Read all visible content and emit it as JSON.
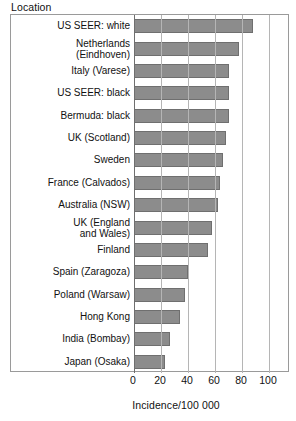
{
  "header": {
    "location_label": "Location"
  },
  "axis": {
    "x_title": "Incidence/100 000",
    "x_ticks": [
      "0",
      "20",
      "40",
      "60",
      "80",
      "100"
    ]
  },
  "colors": {
    "bar_fill": "#8c8c8c",
    "bar_stroke": "#6f6f6f",
    "gridline": "#b5b5b5",
    "frame": "#9a9a9a",
    "text": "#111111"
  },
  "chart_data": {
    "type": "bar",
    "orientation": "horizontal",
    "title": "",
    "subtitle": "",
    "xlabel": "Incidence/100 000",
    "ylabel": "Location",
    "xlim": [
      0,
      100
    ],
    "xticks": [
      0,
      20,
      40,
      60,
      80,
      100
    ],
    "grid": true,
    "legend": "none",
    "categories": [
      "US SEER: white",
      "Netherlands\n(Eindhoven)",
      "Italy (Varese)",
      "US SEER: black",
      "Bermuda: black",
      "UK (Scotland)",
      "Sweden",
      "France (Calvados)",
      "Australia (NSW)",
      "UK (England\nand Wales)",
      "Finland",
      "Spain (Zaragoza)",
      "Poland (Warsaw)",
      "Hong Kong",
      "India (Bombay)",
      "Japan (Osaka)"
    ],
    "values": [
      88,
      78,
      70,
      70,
      70,
      68,
      66,
      64,
      62,
      58,
      55,
      40,
      38,
      34,
      27,
      23
    ]
  }
}
